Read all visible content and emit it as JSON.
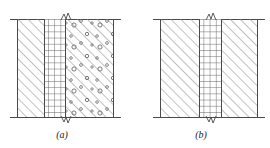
{
  "figure": {
    "type": "engineering-cross-section",
    "panel_count": 2,
    "background_color": "#ffffff",
    "line_color": "#4a4a4a",
    "hatch_color": "#8c8c8c",
    "grid_color": "#5a5a5a"
  },
  "panels": [
    {
      "id": "panel-a",
      "caption": "(a)",
      "caption_x": 62,
      "caption_y": 130,
      "left": 17,
      "top": 19,
      "width": 97,
      "height": 98,
      "cap_left": 10,
      "cap_width": 111,
      "bands": [
        {
          "id": "left-concrete",
          "fill": "diagonal-hatch",
          "x": 0,
          "width": 28,
          "border_left": true,
          "border_right": false
        },
        {
          "id": "core-grid",
          "fill": "cross-grid",
          "x": 28,
          "width": 21,
          "border_left": true,
          "border_right": true
        },
        {
          "id": "right-aggregate",
          "fill": "diagonal-hatch-speckled",
          "x": 49,
          "width": 48,
          "border_left": true,
          "border_right": true
        }
      ],
      "break_marks": [
        {
          "id": "break-top",
          "x": 43,
          "y": 13
        },
        {
          "id": "break-bottom",
          "x": 43,
          "y": 114
        }
      ],
      "labels": [
        {
          "id": "label-a-top",
          "text": "A",
          "x": 46,
          "y": 12
        },
        {
          "id": "label-b-top",
          "text": "B",
          "x": 67,
          "y": 18
        }
      ]
    },
    {
      "id": "panel-b",
      "caption": "(b)",
      "caption_x": 200,
      "caption_y": 130,
      "left": 160,
      "top": 19,
      "width": 98,
      "height": 98,
      "cap_left": 153,
      "cap_width": 112,
      "bands": [
        {
          "id": "left-concrete",
          "fill": "diagonal-hatch",
          "x": 0,
          "width": 40,
          "border_left": true,
          "border_right": true
        },
        {
          "id": "core-grid",
          "fill": "cross-grid",
          "x": 40,
          "width": 22,
          "border_left": true,
          "border_right": true
        },
        {
          "id": "right-concrete",
          "fill": "diagonal-hatch",
          "x": 62,
          "width": 36,
          "border_left": true,
          "border_right": false
        }
      ],
      "break_marks": [
        {
          "id": "break-top",
          "x": 45,
          "y": 13
        },
        {
          "id": "break-bottom",
          "x": 45,
          "y": 114
        }
      ],
      "labels": []
    }
  ]
}
